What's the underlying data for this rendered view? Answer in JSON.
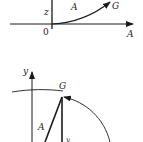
{
  "colors": {
    "stroke": "#1a1a1a",
    "background": "#ffffff",
    "text": "#222222"
  },
  "top_figure": {
    "vertical_axis_label": "z",
    "horizontal_axis_label": "A",
    "origin_label": "0",
    "curve_label": "A",
    "endpoint_label": "G"
  },
  "bottom_figure": {
    "vertical_axis_label": "y",
    "endpoint_label": "G",
    "slanted_line_label": "A",
    "vertical_segment_label": "y"
  }
}
